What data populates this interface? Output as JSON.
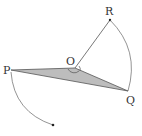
{
  "diagram": {
    "type": "geometry-rotation",
    "points": {
      "P": {
        "label": "P",
        "x": 11,
        "y": 70
      },
      "O": {
        "label": "O",
        "x": 75,
        "y": 68
      },
      "Q": {
        "label": "Q",
        "x": 128,
        "y": 91
      },
      "R": {
        "label": "R",
        "x": 110,
        "y": 20
      },
      "P_prime_end": {
        "x": 53,
        "y": 125
      }
    },
    "shaded_triangle": [
      "P",
      "O",
      "Q"
    ],
    "segments": [
      [
        "O",
        "R"
      ]
    ],
    "arcs": [
      {
        "name": "arc-R-to-Q",
        "from": "R",
        "to": "Q",
        "center": "O"
      },
      {
        "name": "arc-P-rotation",
        "from": "P",
        "to": "P_prime_end",
        "center": "O",
        "arrow": true
      }
    ],
    "colors": {
      "fill": "#bdbdbd",
      "stroke": "#555555"
    }
  }
}
